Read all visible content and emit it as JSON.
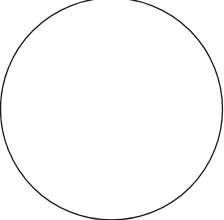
{
  "canvas": {
    "width": 224,
    "height": 220,
    "background": "#ffffff"
  },
  "shape": {
    "type": "circle",
    "cx": 111.5,
    "cy": 109,
    "r": 111,
    "stroke": "#1a1a1a",
    "stroke_width": 1.3,
    "fill": "none"
  }
}
